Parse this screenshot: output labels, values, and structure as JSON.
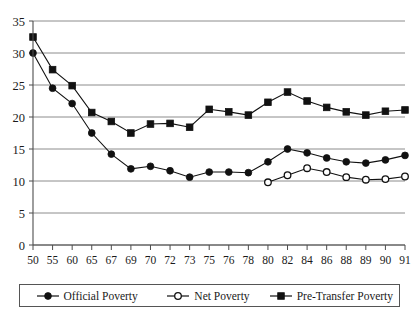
{
  "chart_data": {
    "type": "line",
    "title": "",
    "subtitle": "",
    "xlabel": "",
    "ylabel": "",
    "ylim": [
      0,
      35
    ],
    "ytick_step": 5,
    "yticks": [
      "0",
      "5",
      "10",
      "15",
      "20",
      "25",
      "30",
      "35"
    ],
    "grid": true,
    "grid_axis": "y",
    "legend_position": "bottom",
    "categories": [
      "50",
      "55",
      "60",
      "65",
      "67",
      "69",
      "70",
      "72",
      "73",
      "75",
      "76",
      "78",
      "80",
      "82",
      "84",
      "86",
      "88",
      "89",
      "90",
      "91"
    ],
    "series": [
      {
        "name": "Official Poverty",
        "marker": "filled-circle",
        "values": [
          30.0,
          24.5,
          22.1,
          17.5,
          14.2,
          11.9,
          12.3,
          11.6,
          10.6,
          11.4,
          11.4,
          11.3,
          13.0,
          15.0,
          14.4,
          13.6,
          13.0,
          12.8,
          13.3,
          14.0
        ]
      },
      {
        "name": "Net Poverty",
        "marker": "open-circle",
        "values": [
          null,
          null,
          null,
          null,
          null,
          null,
          null,
          null,
          null,
          null,
          null,
          null,
          9.8,
          10.9,
          12.0,
          11.4,
          10.6,
          10.2,
          10.3,
          10.7
        ]
      },
      {
        "name": "Pre-Transfer Poverty",
        "marker": "filled-square",
        "values": [
          32.5,
          27.4,
          24.9,
          20.7,
          19.3,
          17.5,
          18.9,
          19.0,
          18.4,
          21.2,
          20.8,
          20.3,
          22.3,
          23.9,
          22.5,
          21.5,
          20.8,
          20.3,
          20.9,
          21.1
        ]
      }
    ]
  },
  "legend": {
    "items": [
      {
        "label": "Official Poverty",
        "marker": "filled-circle"
      },
      {
        "label": "Net Poverty",
        "marker": "open-circle"
      },
      {
        "label": "Pre-Transfer Poverty",
        "marker": "filled-square"
      }
    ]
  }
}
